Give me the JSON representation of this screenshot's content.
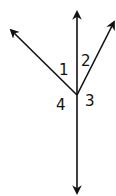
{
  "diagram": {
    "type": "angle-rays",
    "vertex": {
      "x": 77,
      "y": 95
    },
    "rays": [
      {
        "name": "ray-up",
        "tip": {
          "x": 77,
          "y": 12
        }
      },
      {
        "name": "ray-upper-left",
        "tip": {
          "x": 11,
          "y": 30
        }
      },
      {
        "name": "ray-upper-right",
        "tip": {
          "x": 114,
          "y": 22
        }
      },
      {
        "name": "ray-down",
        "tip": {
          "x": 77,
          "y": 193
        }
      }
    ],
    "labels": [
      {
        "text": "1",
        "x": 59,
        "y": 75
      },
      {
        "text": "2",
        "x": 81,
        "y": 66
      },
      {
        "text": "3",
        "x": 85,
        "y": 106
      },
      {
        "text": "4",
        "x": 56,
        "y": 110
      }
    ],
    "colors": {
      "stroke": "#111111",
      "background": "#ffffff"
    }
  }
}
